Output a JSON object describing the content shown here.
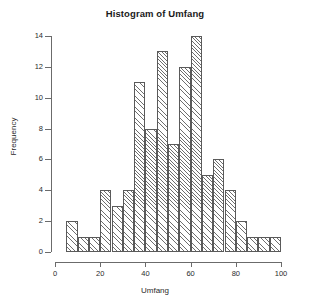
{
  "chart_data": {
    "type": "bar",
    "title": "Histogram of Umfang",
    "xlabel": "Umfang",
    "ylabel": "Frequency",
    "xlim": [
      0,
      100
    ],
    "ylim": [
      0,
      14
    ],
    "grid": false,
    "legend": null,
    "bin_width": 5,
    "bin_starts": [
      5,
      10,
      15,
      20,
      25,
      30,
      35,
      40,
      45,
      50,
      55,
      60,
      65,
      70,
      75,
      80,
      85,
      90,
      95
    ],
    "bin_ends": [
      10,
      15,
      20,
      25,
      30,
      35,
      40,
      45,
      50,
      55,
      60,
      65,
      70,
      75,
      80,
      85,
      90,
      95,
      100
    ],
    "categories": [
      "5-10",
      "10-15",
      "15-20",
      "20-25",
      "25-30",
      "30-35",
      "35-40",
      "40-45",
      "45-50",
      "50-55",
      "55-60",
      "60-65",
      "65-70",
      "70-75",
      "75-80",
      "80-85",
      "85-90",
      "90-95",
      "95-100"
    ],
    "values": [
      2,
      1,
      1,
      4,
      3,
      4,
      11,
      8,
      13,
      7,
      12,
      14,
      5,
      6,
      4,
      2,
      1,
      1,
      1
    ],
    "x_ticks": [
      0,
      20,
      40,
      60,
      80,
      100
    ],
    "x_tick_labels": [
      "0",
      "20",
      "40",
      "60",
      "80",
      "100"
    ],
    "y_ticks": [
      0,
      2,
      4,
      6,
      8,
      10,
      12,
      14
    ],
    "y_tick_labels": [
      "0",
      "2",
      "4",
      "6",
      "8",
      "10",
      "12",
      "14"
    ],
    "bar_fill": "#ffffff",
    "bar_edge": "#5a5a5a",
    "hatch": "diagonal"
  }
}
